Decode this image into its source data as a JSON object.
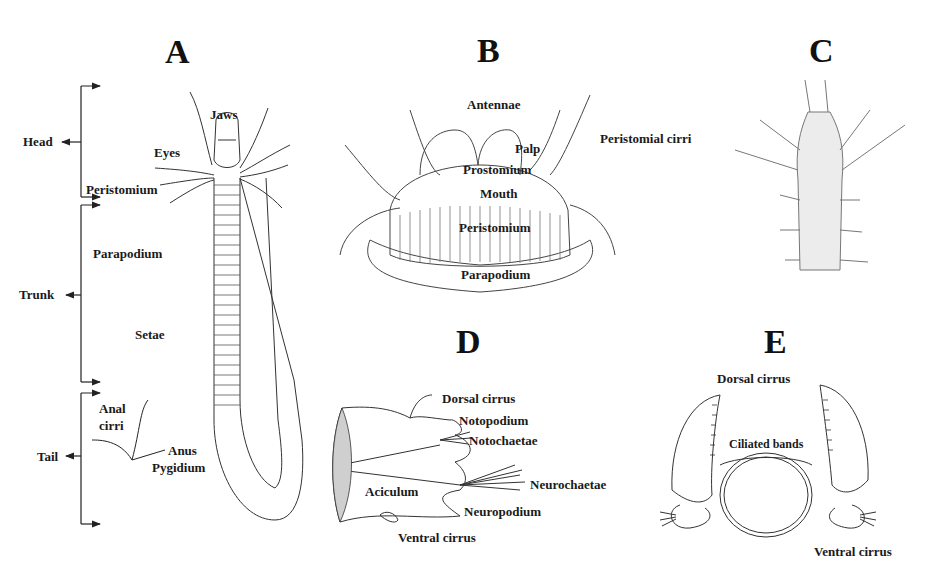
{
  "panels": {
    "A": {
      "letter": "A",
      "regions": [
        "Head",
        "Trunk",
        "Tail"
      ],
      "labels": {
        "jaws": "Jaws",
        "eyes": "Eyes",
        "peristomium": "Peristomium",
        "parapodium": "Parapodium",
        "setae": "Setae",
        "anal_cirri_1": "Anal",
        "anal_cirri_2": "cirri",
        "anus": "Anus",
        "pygidium": "Pygidium"
      }
    },
    "B": {
      "letter": "B",
      "labels": {
        "antennae": "Antennae",
        "palp": "Palp",
        "peristomial_cirri": "Peristomial cirri",
        "prostomium": "Prostomium",
        "mouth": "Mouth",
        "peristomium": "Peristomium",
        "parapodium": "Parapodium"
      }
    },
    "C": {
      "letter": "C"
    },
    "D": {
      "letter": "D",
      "labels": {
        "dorsal_cirrus": "Dorsal cirrus",
        "notopodium": "Notopodium",
        "notochaetae": "Notochaetae",
        "neurochaetae": "Neurochaetae",
        "aciculum": "Aciculum",
        "neuropodium": "Neuropodium",
        "ventral_cirrus": "Ventral cirrus"
      }
    },
    "E": {
      "letter": "E",
      "labels": {
        "dorsal_cirrus": "Dorsal cirrus",
        "ciliated_bands": "Ciliated bands",
        "ventral_cirrus": "Ventral cirrus"
      }
    }
  }
}
